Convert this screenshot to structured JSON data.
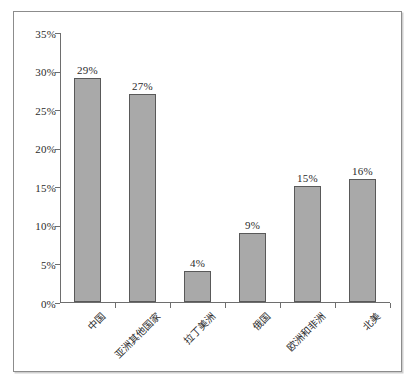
{
  "chart_data": {
    "type": "bar",
    "title": "",
    "subtitle": "",
    "xlabel": "",
    "ylabel": "",
    "categories": [
      "中国",
      "亚洲其他国家",
      "拉丁美洲",
      "俄国",
      "欧洲和非洲",
      "北美"
    ],
    "values": [
      29,
      27,
      4,
      9,
      15,
      16
    ],
    "value_labels": [
      "29%",
      "27%",
      "4%",
      "9%",
      "15%",
      "16%"
    ],
    "ylim": [
      0,
      35
    ],
    "ytick_values": [
      0,
      5,
      10,
      15,
      20,
      25,
      30,
      35
    ],
    "ytick_labels": [
      "0%",
      "5%",
      "10%",
      "15%",
      "20%",
      "25%",
      "30%",
      "35%"
    ],
    "grid": false,
    "legend": null,
    "legend_position": "none",
    "units": "percent",
    "colors": {
      "bar_fill": "#a9a9a9",
      "bar_edge": "#595959",
      "axis": "#6e6e6e",
      "text": "#2b2b2b",
      "background": "#ffffff",
      "frame": "#8c8c8c"
    }
  }
}
